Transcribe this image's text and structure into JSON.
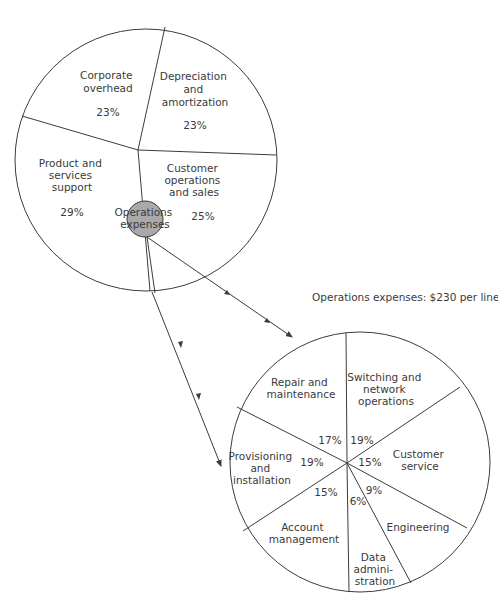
{
  "top_pie": {
    "name": "Total expenses",
    "slices": [
      {
        "label_lines": [
          "Corporate",
          "overhead"
        ],
        "percent": "23%",
        "value": 23
      },
      {
        "label_lines": [
          "Depreciation",
          "and",
          "amortization"
        ],
        "percent": "23%",
        "value": 23
      },
      {
        "label_lines": [
          "Customer",
          "operations",
          "and sales"
        ],
        "percent": "25%",
        "value": 25
      },
      {
        "label_lines": [
          "Product and",
          "services",
          "support"
        ],
        "percent": "29%",
        "value": 29
      }
    ],
    "hub_label_lines": [
      "Operations",
      "expenses"
    ],
    "hub_color": "#a9a9a9"
  },
  "bottom_pie": {
    "caption": "Operations expenses: $230 per line",
    "slices": [
      {
        "label_lines": [
          "Switching and",
          "network",
          "operations"
        ],
        "percent": "19%",
        "value": 19
      },
      {
        "label_lines": [
          "Customer",
          "service"
        ],
        "percent": "15%",
        "value": 15
      },
      {
        "label_lines": [
          "Engineering"
        ],
        "percent": "9%",
        "value": 9
      },
      {
        "label_lines": [
          "Data",
          "admini-",
          "stration"
        ],
        "percent": "6%",
        "value": 6
      },
      {
        "label_lines": [
          "Account",
          "management"
        ],
        "percent": "15%",
        "value": 15
      },
      {
        "label_lines": [
          "Provisioning",
          "and",
          "installation"
        ],
        "percent": "19%",
        "value": 19
      },
      {
        "label_lines": [
          "Repair and",
          "maintenance"
        ],
        "percent": "17%",
        "value": 17
      }
    ]
  },
  "colors": {
    "line": "#3b3b3b",
    "text": "#3a3a3a",
    "background": "#ffffff"
  }
}
